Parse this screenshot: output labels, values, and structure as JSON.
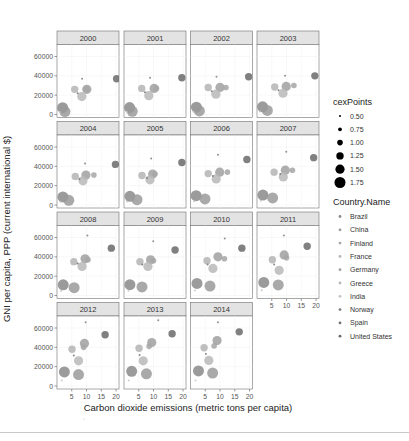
{
  "chart_data": {
    "type": "scatter",
    "title": "",
    "xlabel": "Carbon dioxide emissions (metric tons per capita)",
    "ylabel": "GNI per capita, PPP (current international $)",
    "xlim": [
      0,
      21
    ],
    "ylim": [
      0,
      72000
    ],
    "x_ticks": [
      5,
      10,
      15,
      20
    ],
    "y_ticks": [
      0,
      20000,
      40000,
      60000
    ],
    "grid": true,
    "facet_by": "year",
    "facets": [
      "2000",
      "2001",
      "2002",
      "2003",
      "2004",
      "2005",
      "2006",
      "2007",
      "2008",
      "2009",
      "2010",
      "2011",
      "2012",
      "2013",
      "2014"
    ],
    "legend": {
      "position": "right",
      "size_title": "cexPoints",
      "size_entries": [
        "0.50",
        "0.75",
        "1.00",
        "1.25",
        "1.50",
        "1.75"
      ],
      "color_title": "Country.Name",
      "color_entries": [
        {
          "name": "Brazil",
          "color": "#8a8a8a"
        },
        {
          "name": "China",
          "color": "#9a9a9a"
        },
        {
          "name": "Finland",
          "color": "#a6a6a6"
        },
        {
          "name": "France",
          "color": "#b4b4b4"
        },
        {
          "name": "Germany",
          "color": "#a0a0a0"
        },
        {
          "name": "Greece",
          "color": "#b8b8b8"
        },
        {
          "name": "India",
          "color": "#c4c4c4"
        },
        {
          "name": "Norway",
          "color": "#7e7e7e"
        },
        {
          "name": "Spain",
          "color": "#747474"
        },
        {
          "name": "United States",
          "color": "#6a6a6a"
        }
      ]
    },
    "series": [
      {
        "name": "Brazil",
        "cex": 1.75,
        "points": [
          [
            1.9,
            7000
          ],
          [
            1.9,
            7200
          ],
          [
            2.0,
            7600
          ],
          [
            1.9,
            8000
          ],
          [
            2.0,
            8400
          ],
          [
            2.0,
            9000
          ],
          [
            1.9,
            9600
          ],
          [
            2.0,
            10300
          ],
          [
            2.1,
            11000
          ],
          [
            2.0,
            11200
          ],
          [
            2.2,
            12500
          ],
          [
            2.3,
            13500
          ],
          [
            2.5,
            14500
          ],
          [
            2.6,
            15200
          ],
          [
            2.7,
            15600
          ]
        ]
      },
      {
        "name": "China",
        "cex": 1.75,
        "points": [
          [
            2.7,
            3000
          ],
          [
            2.8,
            3300
          ],
          [
            3.0,
            3700
          ],
          [
            3.5,
            4200
          ],
          [
            4.0,
            4800
          ],
          [
            4.4,
            5500
          ],
          [
            4.9,
            6300
          ],
          [
            5.3,
            7300
          ],
          [
            5.8,
            8100
          ],
          [
            6.1,
            8900
          ],
          [
            6.6,
            9800
          ],
          [
            7.2,
            10900
          ],
          [
            7.3,
            11800
          ],
          [
            7.6,
            12600
          ],
          [
            7.5,
            13400
          ]
        ]
      },
      {
        "name": "Finland",
        "cex": 1.0,
        "points": [
          [
            10.0,
            26000
          ],
          [
            11.0,
            27000
          ],
          [
            12.0,
            28000
          ],
          [
            12.5,
            30000
          ],
          [
            12.5,
            31000
          ],
          [
            10.5,
            32000
          ],
          [
            12.5,
            34000
          ],
          [
            12.0,
            36000
          ],
          [
            10.5,
            37000
          ],
          [
            10.0,
            36000
          ],
          [
            11.5,
            38000
          ],
          [
            10.0,
            39000
          ],
          [
            9.0,
            40000
          ],
          [
            8.5,
            41000
          ],
          [
            8.0,
            41500
          ]
        ]
      },
      {
        "name": "France",
        "cex": 1.25,
        "points": [
          [
            6.0,
            26000
          ],
          [
            6.0,
            27000
          ],
          [
            6.0,
            28000
          ],
          [
            6.0,
            28500
          ],
          [
            6.2,
            29500
          ],
          [
            6.1,
            30500
          ],
          [
            6.0,
            32500
          ],
          [
            5.8,
            34000
          ],
          [
            5.7,
            35000
          ],
          [
            5.4,
            35000
          ],
          [
            5.6,
            36000
          ],
          [
            5.2,
            37000
          ],
          [
            5.1,
            38000
          ],
          [
            5.1,
            39000
          ],
          [
            4.6,
            39500
          ]
        ]
      },
      {
        "name": "Germany",
        "cex": 1.5,
        "points": [
          [
            10.1,
            26000
          ],
          [
            10.2,
            27000
          ],
          [
            10.0,
            28000
          ],
          [
            9.9,
            29000
          ],
          [
            9.8,
            31000
          ],
          [
            9.7,
            32000
          ],
          [
            9.9,
            34000
          ],
          [
            9.6,
            36000
          ],
          [
            9.5,
            38000
          ],
          [
            9.0,
            37000
          ],
          [
            9.3,
            40000
          ],
          [
            9.2,
            42000
          ],
          [
            9.3,
            44000
          ],
          [
            9.4,
            45000
          ],
          [
            9.0,
            47000
          ]
        ]
      },
      {
        "name": "Greece",
        "cex": 1.5,
        "points": [
          [
            8.4,
            18500
          ],
          [
            8.4,
            19500
          ],
          [
            8.6,
            21000
          ],
          [
            8.8,
            22000
          ],
          [
            8.8,
            25000
          ],
          [
            8.8,
            26000
          ],
          [
            8.7,
            27000
          ],
          [
            8.9,
            29000
          ],
          [
            8.5,
            30000
          ],
          [
            8.1,
            30000
          ],
          [
            7.6,
            28000
          ],
          [
            7.5,
            26000
          ],
          [
            7.3,
            26000
          ],
          [
            6.5,
            26000
          ],
          [
            6.2,
            26500
          ]
        ]
      },
      {
        "name": "India",
        "cex": 0.5,
        "points": [
          [
            1.0,
            2500
          ],
          [
            1.0,
            2600
          ],
          [
            1.0,
            2800
          ],
          [
            1.0,
            3000
          ],
          [
            1.1,
            3300
          ],
          [
            1.1,
            3600
          ],
          [
            1.2,
            4000
          ],
          [
            1.3,
            4400
          ],
          [
            1.4,
            4700
          ],
          [
            1.5,
            5000
          ],
          [
            1.5,
            5200
          ],
          [
            1.6,
            5400
          ],
          [
            1.6,
            5600
          ],
          [
            1.6,
            5700
          ],
          [
            1.7,
            5800
          ]
        ]
      },
      {
        "name": "Norway",
        "cex": 0.5,
        "points": [
          [
            8.5,
            37000
          ],
          [
            8.8,
            38000
          ],
          [
            8.8,
            39000
          ],
          [
            9.5,
            40000
          ],
          [
            9.5,
            43000
          ],
          [
            9.2,
            48000
          ],
          [
            9.3,
            52000
          ],
          [
            9.9,
            55000
          ],
          [
            10.3,
            62000
          ],
          [
            9.9,
            56000
          ],
          [
            11.6,
            59000
          ],
          [
            9.1,
            62000
          ],
          [
            9.7,
            66000
          ],
          [
            11.6,
            68000
          ],
          [
            9.3,
            66000
          ]
        ]
      },
      {
        "name": "Spain",
        "cex": 0.5,
        "points": [
          [
            7.0,
            22000
          ],
          [
            7.1,
            23000
          ],
          [
            7.2,
            24000
          ],
          [
            7.3,
            25000
          ],
          [
            7.6,
            27000
          ],
          [
            7.8,
            28000
          ],
          [
            7.6,
            30000
          ],
          [
            7.9,
            32000
          ],
          [
            7.0,
            33000
          ],
          [
            6.2,
            32000
          ],
          [
            5.8,
            32000
          ],
          [
            5.8,
            32000
          ],
          [
            5.7,
            31500
          ],
          [
            5.3,
            32000
          ],
          [
            5.2,
            33000
          ]
        ]
      },
      {
        "name": "United States",
        "cex": 1.25,
        "points": [
          [
            20.2,
            37000
          ],
          [
            19.6,
            38000
          ],
          [
            19.7,
            39000
          ],
          [
            19.6,
            40000
          ],
          [
            19.8,
            42000
          ],
          [
            19.6,
            44000
          ],
          [
            19.1,
            47000
          ],
          [
            19.2,
            49000
          ],
          [
            18.4,
            49000
          ],
          [
            17.3,
            47000
          ],
          [
            17.4,
            49000
          ],
          [
            17.0,
            51000
          ],
          [
            16.3,
            53000
          ],
          [
            16.3,
            54000
          ],
          [
            16.5,
            56000
          ]
        ]
      }
    ]
  }
}
